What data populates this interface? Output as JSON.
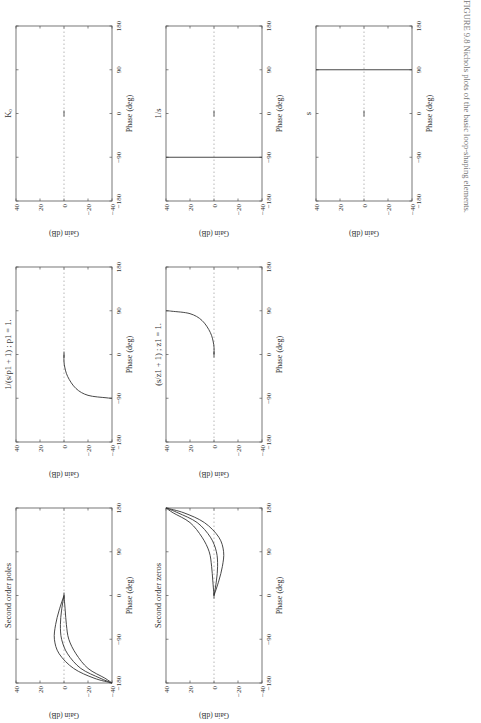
{
  "figure": {
    "caption": "FIGURE 9.8  Nichols plots of the basic loop-shaping elements."
  },
  "axes": {
    "xlabel": "Phase (deg)",
    "ylabel": "Gain (dB)",
    "xticks": [
      "−180",
      "−90",
      "0",
      "90",
      "180"
    ],
    "yticks": [
      "40",
      "20",
      "0",
      "−20",
      "−40"
    ]
  },
  "chart_data": [
    {
      "type": "line",
      "title": "Kₒ",
      "xlabel": "Phase (deg)",
      "ylabel": "Gain (dB)",
      "xlim": [
        -180,
        180
      ],
      "ylim": [
        -40,
        40
      ],
      "series": [
        {
          "name": "Ko",
          "x": [
            0
          ],
          "y": [
            0
          ],
          "note": "single point at origin"
        }
      ]
    },
    {
      "type": "line",
      "title": "1/s",
      "xlabel": "Phase (deg)",
      "ylabel": "Gain (dB)",
      "xlim": [
        -180,
        180
      ],
      "ylim": [
        -40,
        40
      ],
      "series": [
        {
          "name": "1/s",
          "x": [
            -90,
            -90
          ],
          "y": [
            -40,
            40
          ]
        }
      ]
    },
    {
      "type": "line",
      "title": "s",
      "xlabel": "Phase (deg)",
      "ylabel": "Gain (dB)",
      "xlim": [
        -180,
        180
      ],
      "ylim": [
        -40,
        40
      ],
      "series": [
        {
          "name": "s",
          "x": [
            90,
            90
          ],
          "y": [
            -40,
            40
          ]
        }
      ]
    },
    {
      "type": "line",
      "title": "1/(s/p1 + 1) ; p1 = 1.",
      "xlabel": "Phase (deg)",
      "ylabel": "Gain (dB)",
      "xlim": [
        -180,
        180
      ],
      "ylim": [
        -40,
        40
      ],
      "series": [
        {
          "name": "first order pole",
          "x": [
            0,
            -20,
            -45,
            -70,
            -84,
            -89,
            -90
          ],
          "y": [
            0,
            -0.2,
            -3,
            -10,
            -20,
            -35,
            -40
          ]
        }
      ]
    },
    {
      "type": "line",
      "title": "(s/z1 + 1) ; z1 = 1.",
      "xlabel": "Phase (deg)",
      "ylabel": "Gain (dB)",
      "xlim": [
        -180,
        180
      ],
      "ylim": [
        -40,
        40
      ],
      "series": [
        {
          "name": "first order zero",
          "x": [
            0,
            20,
            45,
            70,
            84,
            89,
            90
          ],
          "y": [
            0,
            0.2,
            3,
            10,
            20,
            35,
            40
          ]
        }
      ]
    },
    {
      "type": "line",
      "title": "Second order poles",
      "xlabel": "Phase (deg)",
      "ylabel": "Gain (dB)",
      "xlim": [
        -180,
        180
      ],
      "ylim": [
        -40,
        40
      ],
      "series": [
        {
          "name": "zeta low",
          "x": [
            0,
            -30,
            -60,
            -90,
            -120,
            -150,
            -170,
            -180
          ],
          "y": [
            0,
            4,
            7,
            8,
            4,
            -8,
            -25,
            -40
          ]
        },
        {
          "name": "zeta mid",
          "x": [
            0,
            -30,
            -60,
            -90,
            -120,
            -150,
            -170,
            -180
          ],
          "y": [
            0,
            2,
            3,
            2,
            -3,
            -14,
            -30,
            -40
          ]
        },
        {
          "name": "zeta high",
          "x": [
            0,
            -30,
            -60,
            -90,
            -120,
            -150,
            -170,
            -180
          ],
          "y": [
            0,
            -1,
            -2,
            -4,
            -10,
            -20,
            -34,
            -40
          ]
        }
      ]
    },
    {
      "type": "line",
      "title": "Second order zeros",
      "xlabel": "Phase (deg)",
      "ylabel": "Gain (dB)",
      "xlim": [
        -180,
        180
      ],
      "ylim": [
        -40,
        40
      ],
      "series": [
        {
          "name": "zeta low",
          "x": [
            0,
            30,
            60,
            90,
            120,
            150,
            170,
            180
          ],
          "y": [
            0,
            -4,
            -7,
            -8,
            -4,
            8,
            25,
            40
          ]
        },
        {
          "name": "zeta mid",
          "x": [
            0,
            30,
            60,
            90,
            120,
            150,
            170,
            180
          ],
          "y": [
            0,
            -2,
            -3,
            -2,
            3,
            14,
            30,
            40
          ]
        },
        {
          "name": "zeta high",
          "x": [
            0,
            30,
            60,
            90,
            120,
            150,
            170,
            180
          ],
          "y": [
            0,
            1,
            2,
            4,
            10,
            20,
            34,
            40
          ]
        }
      ]
    }
  ]
}
